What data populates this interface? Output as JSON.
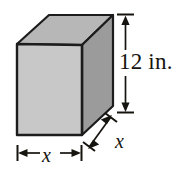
{
  "figure": {
    "kind": "rectangular-prism-diagram",
    "solid": {
      "shape": "rectangular prism",
      "front_face_fill": "#c9c9c9",
      "top_face_fill": "#b9b9b9",
      "right_face_fill": "#9a9a9a",
      "edge_color": "#1c1c1c"
    },
    "dimensions": [
      {
        "name": "height",
        "label": "12 in.",
        "value": 12,
        "unit": "in.",
        "orientation": "vertical",
        "arrow": "double-headed"
      },
      {
        "name": "width",
        "label": "x",
        "value": "x",
        "unit": "",
        "orientation": "horizontal",
        "arrow": "double-headed"
      },
      {
        "name": "depth",
        "label": "x",
        "value": "x",
        "unit": "",
        "orientation": "diagonal",
        "arrow": "double-headed"
      }
    ]
  }
}
